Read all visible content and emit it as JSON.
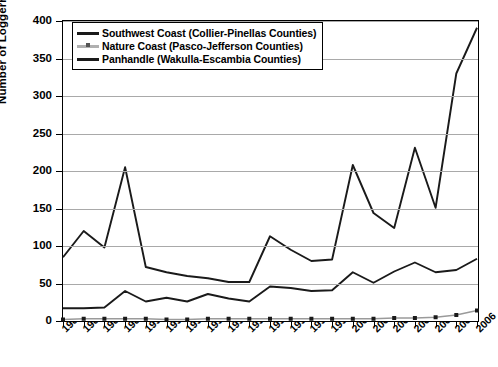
{
  "chart_data": {
    "type": "line",
    "title": "",
    "xlabel": "",
    "ylabel": "Number of Loggerhead Sea Turtle Strandings",
    "ylim": [
      0,
      400
    ],
    "ytick_step": 50,
    "yticks": [
      0,
      50,
      100,
      150,
      200,
      250,
      300,
      350,
      400
    ],
    "grid": true,
    "legend_position": "top-left",
    "categories": [
      "1986",
      "1987",
      "1988",
      "1989",
      "1990",
      "1991",
      "1992",
      "1993",
      "1994",
      "1995",
      "1996",
      "1997",
      "1998",
      "1999",
      "2000",
      "2001",
      "2002",
      "2003",
      "2004",
      "2005",
      "2006"
    ],
    "series": [
      {
        "name": "Southwest Coast (Collier-Pinellas Counties)",
        "color": "#1a1a1a",
        "marker": "none",
        "values": [
          17,
          17,
          18,
          40,
          26,
          31,
          26,
          36,
          30,
          26,
          46,
          44,
          40,
          41,
          65,
          51,
          66,
          78,
          65,
          68,
          83
        ]
      },
      {
        "name": "Nature Coast (Pasco-Jefferson Counties)",
        "color": "#9a9a9a",
        "marker": "square",
        "values": [
          2,
          3,
          3,
          3,
          3,
          2,
          2,
          3,
          3,
          3,
          3,
          3,
          3,
          3,
          3,
          3,
          4,
          4,
          5,
          8,
          14
        ]
      },
      {
        "name": "Panhandle (Wakulla-Escambia Counties)",
        "color": "#1a1a1a",
        "marker": "none",
        "values": [
          85,
          120,
          98,
          205,
          72,
          65,
          60,
          57,
          52,
          52,
          113,
          95,
          80,
          82,
          208,
          144,
          124,
          231,
          151,
          330,
          391
        ]
      }
    ]
  }
}
